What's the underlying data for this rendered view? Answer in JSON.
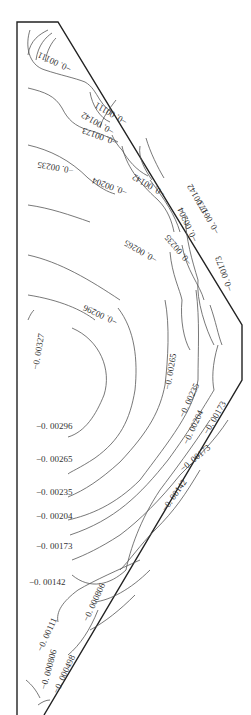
{
  "figure": {
    "type": "contour",
    "levels": [
      "-0.00327",
      "-0.00296",
      "-0.00265",
      "-0.00235",
      "-0.00204",
      "-0.00173",
      "-0.00142",
      "-0.00111",
      "-0.000806",
      "-0.000498"
    ]
  },
  "labels": {
    "l0": "-0.00327",
    "l1": "-0.00296",
    "l2": "-0.00265",
    "l3": "-0.00235",
    "l4": "-0.00204",
    "l5": "-0.00173",
    "l6": "-0.00142",
    "l7": "-0.00111",
    "l8": "-0.000806",
    "l9": "-0.000498",
    "t_00296": "-0.00296",
    "t_00265": "-0.00265",
    "t_00235": "-0.00235",
    "t_00204": "-0.00204",
    "t_00173": "-0.00173",
    "t_00142": "-0.00142",
    "t_00111": "-0.00111",
    "r_00265": "-0.00265",
    "r_00235": "-0.00235",
    "r_00204": "-0.00204",
    "r_00173": "-0.00173",
    "r_00142": "-0.00142",
    "ur_00235": "-0.00235",
    "ur_00204": "-0.00204",
    "ur_00173": "-0.00173",
    "ur_00142": "-0.00142",
    "ur_00111": "-0.00111",
    "b_00806a": "-0.000806",
    "b_00806b": "-0.000806",
    "b_00111": "-0.00111",
    "b_00498": "-0.000498"
  }
}
